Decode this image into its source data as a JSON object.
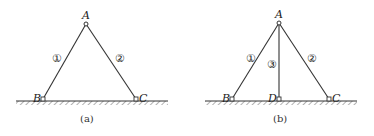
{
  "figures": [
    {
      "id": "a",
      "caption": "(a)",
      "points": {
        "A": "A",
        "B": "B",
        "C": "C"
      },
      "members": [
        {
          "label": "①",
          "from": "A",
          "to": "B"
        },
        {
          "label": "②",
          "from": "A",
          "to": "C"
        }
      ]
    },
    {
      "id": "b",
      "caption": "(b)",
      "points": {
        "A": "A",
        "B": "B",
        "C": "C",
        "D": "D"
      },
      "members": [
        {
          "label": "①",
          "from": "A",
          "to": "B"
        },
        {
          "label": "②",
          "from": "A",
          "to": "C"
        },
        {
          "label": "③",
          "from": "A",
          "to": "D"
        }
      ]
    }
  ],
  "colors": {
    "line": "#333333",
    "ground": "#555555"
  }
}
